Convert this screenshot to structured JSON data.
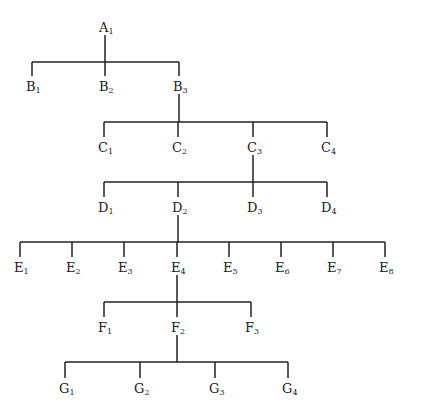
{
  "diagram": {
    "type": "tree",
    "levels": [
      {
        "letter": "A",
        "nodes": [
          {
            "id": "A1",
            "base": "A",
            "sub": "1",
            "x": 105
          }
        ],
        "y": 27,
        "parent": null
      },
      {
        "letter": "B",
        "nodes": [
          {
            "id": "B1",
            "base": "B",
            "sub": "1",
            "x": 32
          },
          {
            "id": "B2",
            "base": "B",
            "sub": "2",
            "x": 105
          },
          {
            "id": "B3",
            "base": "B",
            "sub": "3",
            "x": 179
          }
        ],
        "y": 86,
        "parent": "A1",
        "bar_y": 62
      },
      {
        "letter": "C",
        "nodes": [
          {
            "id": "C1",
            "base": "C",
            "sub": "1",
            "x": 104
          },
          {
            "id": "C2",
            "base": "C",
            "sub": "2",
            "x": 178
          },
          {
            "id": "C3",
            "base": "C",
            "sub": "3",
            "x": 253
          },
          {
            "id": "C4",
            "base": "C",
            "sub": "4",
            "x": 327
          }
        ],
        "y": 147,
        "parent": "B3",
        "bar_y": 122
      },
      {
        "letter": "D",
        "nodes": [
          {
            "id": "D1",
            "base": "D",
            "sub": "1",
            "x": 104
          },
          {
            "id": "D2",
            "base": "D",
            "sub": "2",
            "x": 178
          },
          {
            "id": "D3",
            "base": "D",
            "sub": "3",
            "x": 253
          },
          {
            "id": "D4",
            "base": "D",
            "sub": "4",
            "x": 327
          }
        ],
        "y": 207,
        "parent": "C3",
        "bar_y": 182
      },
      {
        "letter": "E",
        "nodes": [
          {
            "id": "E1",
            "base": "E",
            "sub": "1",
            "x": 20
          },
          {
            "id": "E2",
            "base": "E",
            "sub": "2",
            "x": 72
          },
          {
            "id": "E3",
            "base": "E",
            "sub": "3",
            "x": 124
          },
          {
            "id": "E4",
            "base": "E",
            "sub": "4",
            "x": 177
          },
          {
            "id": "E5",
            "base": "E",
            "sub": "5",
            "x": 229
          },
          {
            "id": "E6",
            "base": "E",
            "sub": "6",
            "x": 281
          },
          {
            "id": "E7",
            "base": "E",
            "sub": "7",
            "x": 333
          },
          {
            "id": "E8",
            "base": "E",
            "sub": "8",
            "x": 385
          }
        ],
        "y": 267,
        "parent": "D2",
        "bar_y": 242
      },
      {
        "letter": "F",
        "nodes": [
          {
            "id": "F1",
            "base": "F",
            "sub": "1",
            "x": 104
          },
          {
            "id": "F2",
            "base": "F",
            "sub": "2",
            "x": 177
          },
          {
            "id": "F3",
            "base": "F",
            "sub": "3",
            "x": 251
          }
        ],
        "y": 327,
        "parent": "E4",
        "bar_y": 302
      },
      {
        "letter": "G",
        "nodes": [
          {
            "id": "G1",
            "base": "G",
            "sub": "1",
            "x": 65
          },
          {
            "id": "G2",
            "base": "G",
            "sub": "2",
            "x": 140
          },
          {
            "id": "G3",
            "base": "G",
            "sub": "3",
            "x": 215
          },
          {
            "id": "G4",
            "base": "G",
            "sub": "4",
            "x": 288
          }
        ],
        "y": 388,
        "parent": "F2",
        "bar_y": 362
      }
    ],
    "colors": {
      "line": "#222222",
      "text": "#222222",
      "background": "#ffffff"
    }
  }
}
